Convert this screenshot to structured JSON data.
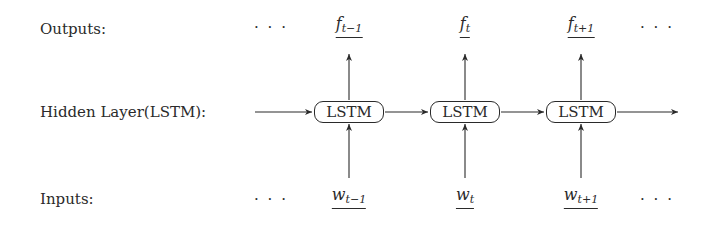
{
  "rows": {
    "outputs_label": "Outputs:",
    "hidden_label": "Hidden Layer(LSTM):",
    "inputs_label": "Inputs:"
  },
  "ellipsis": "· · ·",
  "cells": [
    {
      "output": {
        "base": "f",
        "sub": "t−1"
      },
      "unit": "LSTM",
      "input": {
        "base": "w",
        "sub": "t−1"
      }
    },
    {
      "output": {
        "base": "f",
        "sub": "t"
      },
      "unit": "LSTM",
      "input": {
        "base": "w",
        "sub": "t"
      }
    },
    {
      "output": {
        "base": "f",
        "sub": "t+1"
      },
      "unit": "LSTM",
      "input": {
        "base": "w",
        "sub": "t+1"
      }
    }
  ],
  "colors": {
    "ink": "#2a2a2a",
    "background": "#ffffff"
  }
}
